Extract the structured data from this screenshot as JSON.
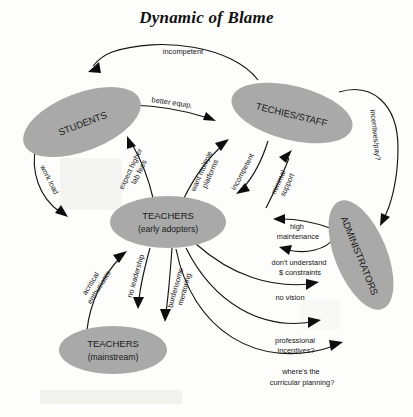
{
  "title": "Dynamic of Blame",
  "diagram": {
    "type": "directed-graph",
    "nodes": [
      {
        "id": "students",
        "label_line1": "STUDENTS",
        "label_line2": "",
        "rotation_deg": -21,
        "cx": 82,
        "cy": 122,
        "rx": 62,
        "ry": 29
      },
      {
        "id": "techies",
        "label_line1": "TECHIES/STAFF",
        "label_line2": "",
        "rotation_deg": 14,
        "cx": 292,
        "cy": 113,
        "rx": 62,
        "ry": 27
      },
      {
        "id": "teachers_early",
        "label_line1": "TEACHERS",
        "label_line2": "(early adopters)",
        "rotation_deg": 0,
        "cx": 168,
        "cy": 222,
        "rx": 58,
        "ry": 26
      },
      {
        "id": "teachers_main",
        "label_line1": "TEACHERS",
        "label_line2": "(mainstream)",
        "rotation_deg": 0,
        "cx": 113,
        "cy": 350,
        "rx": 54,
        "ry": 24
      },
      {
        "id": "administrators",
        "label_line1": "ADMINISTRATORS",
        "label_line2": "",
        "rotation_deg": 68,
        "cx": 361,
        "cy": 255,
        "rx": 58,
        "ry": 26
      }
    ],
    "edges": [
      {
        "id": "e1",
        "from": "techies",
        "to": "students",
        "label": "incompetent",
        "label_lines": [
          "incompetent"
        ]
      },
      {
        "id": "e2",
        "from": "students",
        "to": "techies",
        "label": "better equip.",
        "label_lines": [
          "better equip."
        ]
      },
      {
        "id": "e3",
        "from": "teachers_early",
        "to": "students",
        "label": "expect higher lab fees",
        "label_lines": [
          "expect higher",
          "lab fees"
        ]
      },
      {
        "id": "e4",
        "from": "students",
        "to": "teachers_early",
        "label": "work load",
        "label_lines": [
          "work load"
        ]
      },
      {
        "id": "e5",
        "from": "teachers_early",
        "to": "techies",
        "label": "want multiple platforms",
        "label_lines": [
          "want multiple",
          "platforms"
        ]
      },
      {
        "id": "e6",
        "from": "techies",
        "to": "teachers_early",
        "label": "incompetent",
        "label_lines": [
          "incompetent"
        ]
      },
      {
        "id": "e7",
        "from": "teachers_early",
        "to": "techies",
        "label": "minimal support",
        "label_lines": [
          "minimal",
          "support"
        ]
      },
      {
        "id": "e8",
        "from": "techies",
        "to": "administrators",
        "label": "incentives/pay?",
        "label_lines": [
          "incentives/pay?"
        ]
      },
      {
        "id": "e9",
        "from": "administrators",
        "to": "teachers_early",
        "label": "high maintenance",
        "label_lines": [
          "high",
          "maintenance"
        ]
      },
      {
        "id": "e10",
        "from": "administrators",
        "to": "teachers_early",
        "label": "don't understand $ constraints",
        "label_lines": [
          "don't understand",
          "$ constraints"
        ]
      },
      {
        "id": "e11",
        "from": "teachers_early",
        "to": "administrators",
        "label": "no vision",
        "label_lines": [
          "no vision"
        ]
      },
      {
        "id": "e12",
        "from": "teachers_early",
        "to": "administrators",
        "label": "professional incentives?",
        "label_lines": [
          "professional",
          "incentives?"
        ]
      },
      {
        "id": "e13",
        "from": "teachers_early",
        "to": "administrators",
        "label": "where's the curricular planning?",
        "label_lines": [
          "where's the",
          "curricular planning?"
        ]
      },
      {
        "id": "e14",
        "from": "teachers_main",
        "to": "teachers_early",
        "label": "acritical enthusiasts",
        "label_lines": [
          "acritical",
          "enthusiasts"
        ]
      },
      {
        "id": "e15",
        "from": "teachers_early",
        "to": "teachers_main",
        "label": "no leadership",
        "label_lines": [
          "no leadership"
        ]
      },
      {
        "id": "e16",
        "from": "teachers_early",
        "to": "teachers_main",
        "label": "burdensome mentoring",
        "label_lines": [
          "burdensome",
          "mentoring"
        ]
      }
    ]
  },
  "colors": {
    "node_fill": "#a9a9a9",
    "stroke": "#151515",
    "text": "#1a1a1a",
    "background": "#fdfdfc"
  }
}
